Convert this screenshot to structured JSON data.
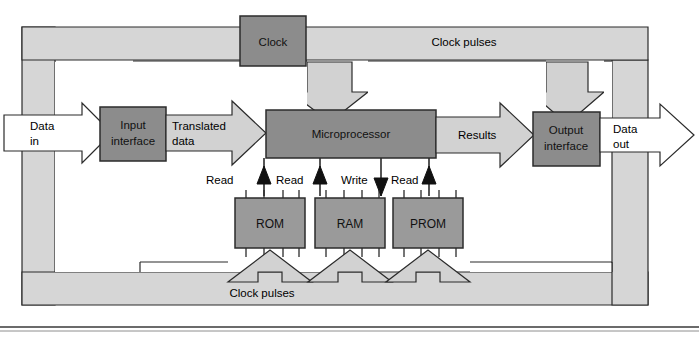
{
  "figure": {
    "colors": {
      "band_fill": "#d6d6d6",
      "arrow_fill": "#d2d2d2",
      "arrow_white": "#ffffff",
      "chip_fill": "#8c8c8c",
      "chip_fill_light": "#9a9a9a",
      "stroke": "#2b2b2b",
      "text": "#000000",
      "page_bg": "#ffffff"
    }
  },
  "blocks": {
    "clock": "Clock",
    "input_interface": "Input\ninterface",
    "input_interface_l1": "Input",
    "input_interface_l2": "interface",
    "microprocessor": "Microprocessor",
    "output_interface_l1": "Output",
    "output_interface_l2": "interface",
    "rom": "ROM",
    "ram": "RAM",
    "prom": "PROM"
  },
  "flow_labels": {
    "data_in_l1": "Data",
    "data_in_l2": "in",
    "translated_l1": "Translated",
    "translated_l2": "data",
    "results": "Results",
    "data_out_l1": "Data",
    "data_out_l2": "out",
    "clock_pulses_top": "Clock pulses",
    "clock_pulses_bottom": "Clock pulses"
  },
  "control_signals": [
    {
      "label": "Read",
      "direction": "up",
      "target": "ROM"
    },
    {
      "label": "Read",
      "direction": "up",
      "target": "RAM"
    },
    {
      "label": "Write",
      "direction": "down",
      "target": "RAM"
    },
    {
      "label": "Read",
      "direction": "up",
      "target": "PROM"
    }
  ],
  "memory_chips": [
    {
      "name": "ROM",
      "pins_top": 4,
      "pins_bottom": 4
    },
    {
      "name": "RAM",
      "pins_top": 4,
      "pins_bottom": 4
    },
    {
      "name": "PROM",
      "pins_top": 4,
      "pins_bottom": 4
    }
  ],
  "connections": [
    {
      "from": "Data in",
      "to": "Input interface",
      "kind": "data-arrow"
    },
    {
      "from": "Input interface",
      "to": "Microprocessor",
      "kind": "data-arrow",
      "label": "Translated data"
    },
    {
      "from": "Microprocessor",
      "to": "Output interface",
      "kind": "data-arrow",
      "label": "Results"
    },
    {
      "from": "Output interface",
      "to": "Data out",
      "kind": "data-arrow"
    },
    {
      "from": "Clock",
      "to": "Input interface",
      "kind": "clock-arrow"
    },
    {
      "from": "Clock",
      "to": "Microprocessor",
      "kind": "clock-arrow"
    },
    {
      "from": "Clock",
      "to": "Output interface",
      "kind": "clock-arrow"
    },
    {
      "from": "Clock",
      "to": "ROM",
      "kind": "clock-arrow"
    },
    {
      "from": "Clock",
      "to": "RAM",
      "kind": "clock-arrow"
    },
    {
      "from": "Clock",
      "to": "PROM",
      "kind": "clock-arrow"
    }
  ]
}
